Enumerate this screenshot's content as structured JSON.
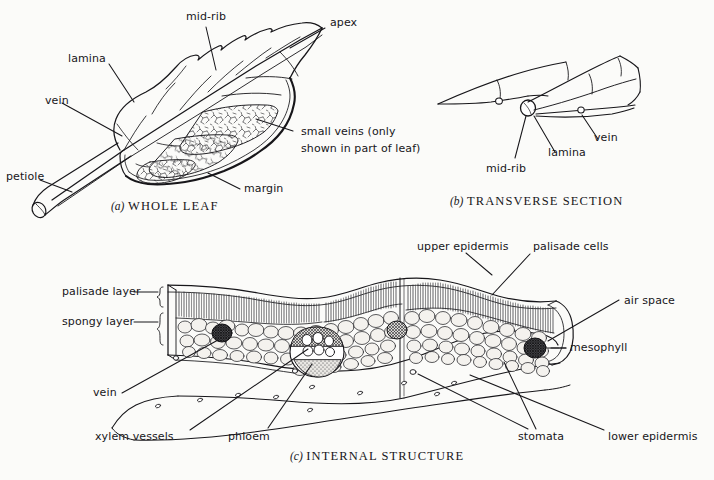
{
  "figure": {
    "background_color": "#fbfbf9",
    "ink_color": "#17161a",
    "panels": [
      {
        "id": "a",
        "index_label": "(a)",
        "caption": "WHOLE LEAF",
        "labels": [
          "mid-rib",
          "apex",
          "lamina",
          "vein",
          "petiole",
          "small veins (only shown in part of leaf)",
          "margin"
        ]
      },
      {
        "id": "b",
        "index_label": "(b)",
        "caption": "TRANSVERSE SECTION",
        "labels": [
          "vein",
          "lamina",
          "mid-rib"
        ]
      },
      {
        "id": "c",
        "index_label": "(c)",
        "caption": "INTERNAL STRUCTURE",
        "labels": [
          "upper epidermis",
          "palisade cells",
          "air space",
          "mesophyll",
          "palisade layer",
          "spongy layer",
          "vein",
          "xylem vessels",
          "phloem",
          "stomata",
          "lower epidermis"
        ]
      }
    ]
  },
  "panel_a": {
    "index": "(a)",
    "caption": "WHOLE LEAF",
    "labels": {
      "midrib": "mid-rib",
      "apex": "apex",
      "lamina": "lamina",
      "vein": "vein",
      "petiole": "petiole",
      "small_veins_line1": "small veins (only",
      "small_veins_line2": "shown in part of leaf)",
      "margin": "margin"
    }
  },
  "panel_b": {
    "index": "(b)",
    "caption": "TRANSVERSE SECTION",
    "labels": {
      "vein": "vein",
      "lamina": "lamina",
      "midrib": "mid-rib"
    }
  },
  "panel_c": {
    "index": "(c)",
    "caption": "INTERNAL STRUCTURE",
    "labels": {
      "upper_epidermis": "upper epidermis",
      "palisade_cells": "palisade cells",
      "air_space": "air space",
      "mesophyll": "mesophyll",
      "palisade_layer": "palisade layer",
      "spongy_layer": "spongy layer",
      "vein": "vein",
      "xylem_vessels": "xylem vessels",
      "phloem": "phloem",
      "stomata": "stomata",
      "lower_epidermis": "lower epidermis"
    }
  }
}
